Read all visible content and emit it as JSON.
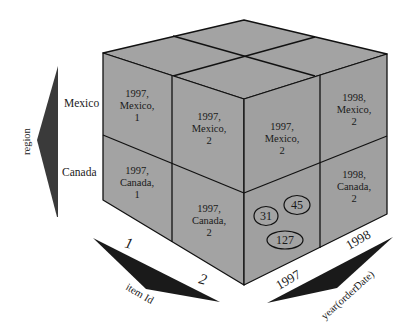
{
  "diagram": {
    "type": "olap-data-cube",
    "colors": {
      "face": "#a3a3a3",
      "edge": "#111111",
      "region_arrow": "#3a3a3a",
      "axis_arrow": "#1a1a1a"
    },
    "axes": {
      "region": {
        "label": "region",
        "members": [
          "Mexico",
          "Canada"
        ]
      },
      "item": {
        "label": "item Id",
        "members": [
          "1",
          "2"
        ]
      },
      "year": {
        "label": "year(orderDate)",
        "members": [
          "1997",
          "1998"
        ]
      }
    },
    "front_face_cells": [
      {
        "id": "mx-1",
        "line1": "1997,",
        "line2": "Mexico,",
        "line3": "1"
      },
      {
        "id": "mx-2",
        "line1": "1997,",
        "line2": "Mexico,",
        "line3": "2"
      },
      {
        "id": "ca-1",
        "line1": "1997,",
        "line2": "Canada,",
        "line3": "1"
      },
      {
        "id": "ca-2",
        "line1": "1997,",
        "line2": "Canada,",
        "line3": "2"
      }
    ],
    "right_face_cells": [
      {
        "id": "r-mx-97",
        "line1": "1997,",
        "line2": "Mexico,",
        "line3": "2"
      },
      {
        "id": "r-mx-98",
        "line1": "1998,",
        "line2": "Mexico,",
        "line3": "2"
      },
      {
        "id": "r-ca-98",
        "line1": "1998,",
        "line2": "Canada,",
        "line3": "2"
      }
    ],
    "measure_values": [
      "31",
      "45",
      "127"
    ]
  }
}
